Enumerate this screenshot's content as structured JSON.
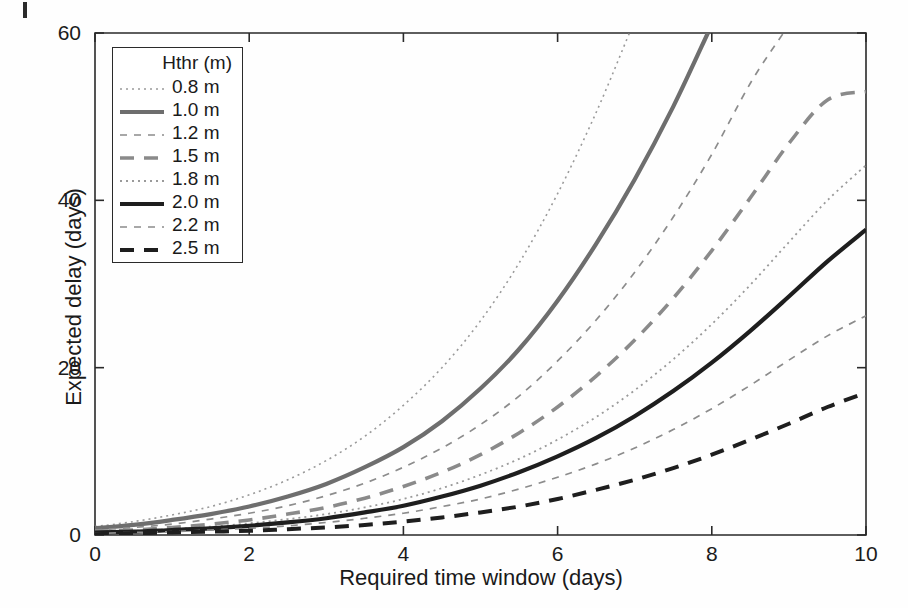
{
  "chart_data": {
    "type": "line",
    "title": "",
    "xlabel": "Required time window (days)",
    "ylabel": "Expected delay (days)",
    "xlim": [
      0,
      10
    ],
    "ylim": [
      0,
      60
    ],
    "xticks": [
      "0",
      "2",
      "4",
      "6",
      "8",
      "10"
    ],
    "yticks": [
      "0",
      "20",
      "40",
      "60"
    ],
    "grid": false,
    "legend_position": "top-left-inside",
    "legend_title": "Hthr (m)",
    "x": [
      0,
      0.5,
      1,
      1.5,
      2,
      2.5,
      3,
      3.5,
      4,
      4.5,
      5,
      5.5,
      6,
      6.5,
      7,
      7.5,
      8,
      8.5,
      9,
      9.5,
      10
    ],
    "series": [
      {
        "name": "0.8 m",
        "label": "0.8 m",
        "style": "dotted",
        "color": "#9a9a9a",
        "width": 1.6,
        "values": [
          1.0,
          1.6,
          2.4,
          3.4,
          4.8,
          6.6,
          8.9,
          11.8,
          15.5,
          20.0,
          25.6,
          32.5,
          40.8,
          50.5,
          61.5,
          null,
          null,
          null,
          null,
          null,
          null
        ]
      },
      {
        "name": "1.0 m",
        "label": "1.0 m",
        "style": "solid",
        "color": "#6e6e6e",
        "width": 4.2,
        "values": [
          0.8,
          1.2,
          1.8,
          2.5,
          3.4,
          4.6,
          6.1,
          8.1,
          10.5,
          13.6,
          17.5,
          22.2,
          28.0,
          34.8,
          42.5,
          51.2,
          61.0,
          null,
          null,
          null,
          null
        ]
      },
      {
        "name": "1.2 m",
        "label": "1.2 m",
        "style": "dashed-fine",
        "color": "#8c8c8c",
        "width": 1.7,
        "values": [
          0.6,
          0.9,
          1.3,
          1.9,
          2.6,
          3.5,
          4.7,
          6.2,
          8.1,
          10.4,
          13.2,
          16.6,
          20.8,
          25.7,
          31.4,
          38.0,
          45.5,
          54.0,
          61.0,
          null,
          null
        ]
      },
      {
        "name": "1.5 m",
        "label": "1.5 m",
        "style": "dashed",
        "color": "#8a8a8a",
        "width": 3.6,
        "values": [
          0.4,
          0.6,
          0.9,
          1.3,
          1.8,
          2.5,
          3.3,
          4.4,
          5.8,
          7.5,
          9.6,
          12.2,
          15.3,
          19.0,
          23.3,
          28.3,
          34.0,
          40.3,
          46.8,
          52.0,
          53.0
        ]
      },
      {
        "name": "1.8 m",
        "label": "1.8 m",
        "style": "dotted",
        "color": "#9a9a9a",
        "width": 1.8,
        "values": [
          0.3,
          0.5,
          0.7,
          1.0,
          1.4,
          1.9,
          2.5,
          3.3,
          4.3,
          5.6,
          7.2,
          9.1,
          11.4,
          14.1,
          17.3,
          21.0,
          25.2,
          29.9,
          35.0,
          40.0,
          44.2
        ]
      },
      {
        "name": "2.0 m",
        "label": "2.0 m",
        "style": "solid",
        "color": "#1e1e1e",
        "width": 4.2,
        "values": [
          0.3,
          0.4,
          0.6,
          0.8,
          1.1,
          1.5,
          2.0,
          2.7,
          3.5,
          4.6,
          5.9,
          7.5,
          9.4,
          11.6,
          14.2,
          17.2,
          20.6,
          24.4,
          28.5,
          32.7,
          36.5
        ]
      },
      {
        "name": "2.2 m",
        "label": "2.2 m",
        "style": "dashed-fine",
        "color": "#8c8c8c",
        "width": 1.7,
        "values": [
          0.2,
          0.3,
          0.4,
          0.6,
          0.8,
          1.1,
          1.5,
          2.0,
          2.6,
          3.4,
          4.3,
          5.5,
          6.9,
          8.5,
          10.4,
          12.6,
          15.1,
          17.9,
          20.9,
          23.8,
          26.2
        ]
      },
      {
        "name": "2.5 m",
        "label": "2.5 m",
        "style": "dashed",
        "color": "#1e1e1e",
        "width": 4.0,
        "values": [
          0.1,
          0.2,
          0.3,
          0.4,
          0.5,
          0.7,
          0.9,
          1.2,
          1.6,
          2.1,
          2.7,
          3.4,
          4.3,
          5.4,
          6.6,
          8.0,
          9.6,
          11.4,
          13.3,
          15.3,
          17.0
        ]
      }
    ]
  },
  "axes": {
    "x_tick_labels": [
      "0",
      "2",
      "4",
      "6",
      "8",
      "10"
    ],
    "x_tick_values": [
      0,
      2,
      4,
      6,
      8,
      10
    ],
    "y_tick_labels": [
      "0",
      "20",
      "40",
      "60"
    ],
    "y_tick_values": [
      0,
      20,
      40,
      60
    ],
    "x_axis_label": "Required time window (days)",
    "y_axis_label": "Expected delay (days)"
  },
  "legend": {
    "title": "Hthr (m)",
    "entries": [
      {
        "label": "0.8 m"
      },
      {
        "label": "1.0 m"
      },
      {
        "label": "1.2 m"
      },
      {
        "label": "1.5 m"
      },
      {
        "label": "1.8 m"
      },
      {
        "label": "2.0 m"
      },
      {
        "label": "2.2 m"
      },
      {
        "label": "2.5 m"
      }
    ]
  },
  "colors": {
    "axis": "#2a2a2a",
    "background": "#fefefe",
    "dark_series": "#1e1e1e",
    "gray_series": "#8a8a8a",
    "light_series": "#9a9a9a"
  }
}
